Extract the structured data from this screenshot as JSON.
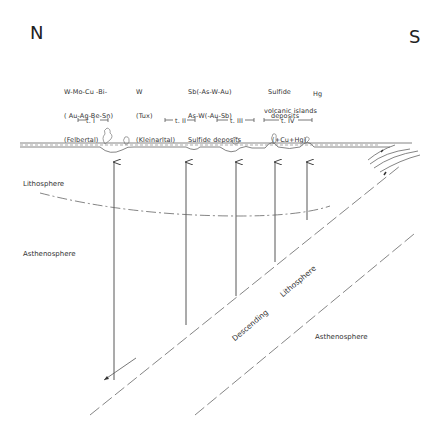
{
  "compass": {
    "north": "N",
    "south": "S"
  },
  "deposits": [
    {
      "id": "t1",
      "lines": [
        "W-Mo-Cu -Bi-",
        "( Au-Ag-Be-Sn)",
        "(Felbertal)"
      ]
    },
    {
      "id": "t2",
      "lines": [
        "W",
        "(Tux)",
        "(Kleinarltal)"
      ]
    },
    {
      "id": "t3",
      "lines": [
        "Sb(-As-W-Au)",
        "As-W(-Au-Sb)",
        "Sulfide deposits"
      ]
    },
    {
      "id": "t4",
      "lines": [
        "Sulfide",
        "deposits",
        "(+Cu+Hg)"
      ]
    },
    {
      "id": "hg",
      "lines": [
        "Hg"
      ]
    }
  ],
  "volcanic_islands_label": "volcanic islands",
  "time_intervals": [
    {
      "label": "t. I"
    },
    {
      "label": "t. II"
    },
    {
      "label": "t. III"
    },
    {
      "label": "t. IV"
    }
  ],
  "layers": {
    "lithosphere": "Lithosphere",
    "asthenosphere_left": "Asthenosphere",
    "descending": "Descending",
    "descending_lithosphere": "Lithosphere",
    "asthenosphere_right": "Asthenosphere"
  },
  "colors": {
    "line": "#555555",
    "text": "#333333",
    "background": "#ffffff"
  }
}
